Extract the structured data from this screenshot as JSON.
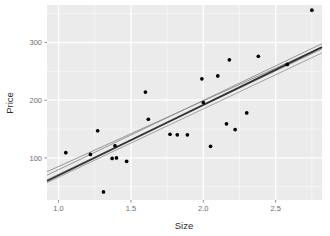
{
  "chart_data": {
    "type": "scatter",
    "title": "",
    "xlabel": "Size",
    "ylabel": "Price",
    "xlim": [
      0.92,
      2.82
    ],
    "ylim": [
      27,
      365
    ],
    "xticks": [
      1.0,
      1.5,
      2.0,
      2.5
    ],
    "xticklabels": [
      "1.0",
      "1.5",
      "2.0",
      "2.5"
    ],
    "yticks": [
      100,
      200,
      300
    ],
    "yticklabels": [
      "100",
      "200",
      "300"
    ],
    "grid": true,
    "grid_color": "#ffffff",
    "panel_background": "#ebebeb",
    "legend": "none",
    "point_color": "#000000",
    "point_size": 3.4,
    "points": [
      {
        "x": 1.05,
        "y": 109
      },
      {
        "x": 1.22,
        "y": 106
      },
      {
        "x": 1.27,
        "y": 147
      },
      {
        "x": 1.31,
        "y": 41
      },
      {
        "x": 1.37,
        "y": 99
      },
      {
        "x": 1.39,
        "y": 121
      },
      {
        "x": 1.4,
        "y": 100
      },
      {
        "x": 1.47,
        "y": 94
      },
      {
        "x": 1.6,
        "y": 214
      },
      {
        "x": 1.62,
        "y": 167
      },
      {
        "x": 1.77,
        "y": 141
      },
      {
        "x": 1.82,
        "y": 140
      },
      {
        "x": 1.89,
        "y": 140
      },
      {
        "x": 1.99,
        "y": 237
      },
      {
        "x": 2.0,
        "y": 196
      },
      {
        "x": 2.05,
        "y": 120
      },
      {
        "x": 2.1,
        "y": 242
      },
      {
        "x": 2.16,
        "y": 159
      },
      {
        "x": 2.18,
        "y": 270
      },
      {
        "x": 2.22,
        "y": 149
      },
      {
        "x": 2.3,
        "y": 178
      },
      {
        "x": 2.38,
        "y": 276
      },
      {
        "x": 2.58,
        "y": 262
      },
      {
        "x": 2.75,
        "y": 356
      }
    ],
    "regression_lines": [
      {
        "name": "bootstrap-fit-1",
        "x0": 0.92,
        "y0": 70,
        "x1": 2.82,
        "y1": 298,
        "color": "#8c8c8c",
        "width": 0.9
      },
      {
        "name": "bootstrap-fit-2",
        "x0": 0.92,
        "y0": 76,
        "x1": 2.82,
        "y1": 292,
        "color": "#8c8c8c",
        "width": 0.9
      },
      {
        "name": "bootstrap-fit-3",
        "x0": 0.92,
        "y0": 62,
        "x1": 2.82,
        "y1": 289,
        "color": "#8c8c8c",
        "width": 0.9
      },
      {
        "name": "bootstrap-fit-4",
        "x0": 0.92,
        "y0": 57,
        "x1": 2.82,
        "y1": 282,
        "color": "#9a9a9a",
        "width": 0.9
      },
      {
        "name": "primary-fit",
        "x0": 0.92,
        "y0": 60,
        "x1": 2.82,
        "y1": 292,
        "color": "#333333",
        "width": 1.8
      }
    ],
    "fit_points": [
      {
        "x": 1.22,
        "y": 106
      },
      {
        "x": 1.39,
        "y": 121
      },
      {
        "x": 2.0,
        "y": 196
      },
      {
        "x": 2.58,
        "y": 262
      }
    ]
  },
  "axes": {
    "y_title": "Price",
    "x_title": "Size"
  }
}
